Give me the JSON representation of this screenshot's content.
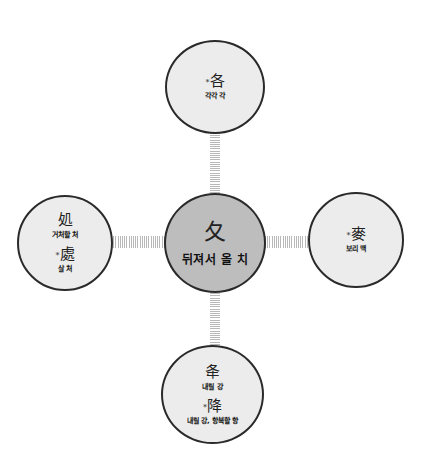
{
  "diagram": {
    "center": {
      "hanja": "夂",
      "meaning": "뒤져서 올 치"
    },
    "top": {
      "entries": [
        {
          "marker": "*",
          "hanja": "各",
          "meaning": "각각 각"
        }
      ]
    },
    "left": {
      "entries": [
        {
          "marker": "",
          "hanja": "処",
          "meaning": "거처할 처"
        },
        {
          "marker": "*",
          "hanja": "處",
          "meaning": "살 처"
        }
      ]
    },
    "right": {
      "entries": [
        {
          "marker": "*",
          "hanja": "麥",
          "meaning": "보리 맥"
        }
      ]
    },
    "bottom": {
      "entries": [
        {
          "marker": "",
          "hanja": "夅",
          "meaning": "내릴 강"
        },
        {
          "marker": "*",
          "hanja": "降",
          "meaning": "내릴 강, 항복할 항"
        }
      ]
    }
  },
  "colors": {
    "center_fill": "#bdbdbd",
    "node_fill": "#ececec",
    "border": "#2a2a2a",
    "connector": "#b8b8b8"
  }
}
